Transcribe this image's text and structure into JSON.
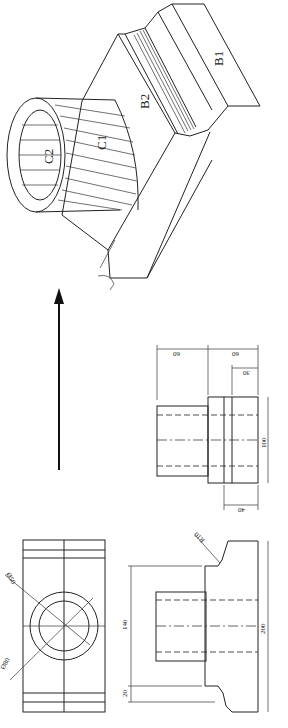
{
  "isometric": {
    "labels": {
      "b1": "B1",
      "b2": "B2",
      "c1": "C1",
      "c2": "C2"
    }
  },
  "arrow": {
    "direction": "up"
  },
  "top_view": {
    "dimensions": {
      "w1": "60",
      "w2": "60",
      "w3": "30",
      "h": "100",
      "bottom": "40"
    }
  },
  "front_view": {
    "dimensions": {
      "radius": "R10",
      "height_total": "200",
      "height_inner": "140",
      "offset": "20"
    }
  },
  "side_view": {
    "dimensions": {
      "dia_outer": "Ø50",
      "dia_inner": "Ø80"
    }
  }
}
